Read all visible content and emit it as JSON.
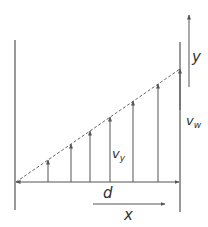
{
  "diagram": {
    "labels": {
      "y_axis": "y",
      "wall_velocity": "v",
      "wall_velocity_sub": "w",
      "local_velocity": "v",
      "local_velocity_sub": "y",
      "distance": "d",
      "x_axis": "x"
    },
    "colors": {
      "stroke": "#555555",
      "text": "#333333"
    },
    "walls": {
      "left_x": 15,
      "right_x": 180
    },
    "velocity_arrows_x": [
      48,
      71,
      90,
      110,
      133,
      158
    ]
  }
}
